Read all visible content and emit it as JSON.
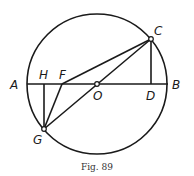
{
  "figure": {
    "caption": "Fig. 89",
    "circle": {
      "center": "O",
      "cx": 97,
      "cy": 84,
      "r": 70
    },
    "points": {
      "A": {
        "label": "A",
        "x": 27,
        "y": 84
      },
      "B": {
        "label": "B",
        "x": 167,
        "y": 84
      },
      "O": {
        "label": "O",
        "x": 97,
        "y": 84
      },
      "C": {
        "label": "C",
        "x": 151,
        "y": 39
      },
      "D": {
        "label": "D",
        "x": 151,
        "y": 84
      },
      "H": {
        "label": "H",
        "x": 44,
        "y": 84
      },
      "F": {
        "label": "F",
        "x": 62,
        "y": 84
      },
      "G": {
        "label": "G",
        "x": 44,
        "y": 129
      }
    },
    "segments": [
      "AB",
      "CD",
      "CF",
      "CG",
      "GH",
      "GF"
    ]
  }
}
